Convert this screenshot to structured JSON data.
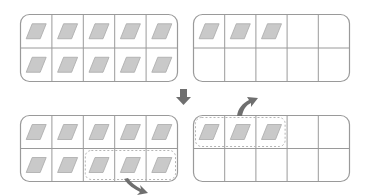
{
  "diagram": {
    "colors": {
      "frame_stroke": "#9a9a9a",
      "grid_stroke": "#9a9a9a",
      "card_fill": "#c9c9c9",
      "card_stroke": "#aaaaaa",
      "arrow_fill": "#6f6f6f",
      "highlight_stroke": "#b5b5b5"
    },
    "frames": [
      {
        "id": "top-left",
        "rows": 2,
        "cols": 5,
        "filled": [
          [
            1,
            1,
            1,
            1,
            1
          ],
          [
            1,
            1,
            1,
            1,
            1
          ]
        ],
        "count": 10
      },
      {
        "id": "top-right",
        "rows": 2,
        "cols": 5,
        "filled": [
          [
            1,
            1,
            1,
            0,
            0
          ],
          [
            0,
            0,
            0,
            0,
            0
          ]
        ],
        "count": 3
      },
      {
        "id": "bottom-left",
        "rows": 2,
        "cols": 5,
        "filled": [
          [
            1,
            1,
            1,
            1,
            1
          ],
          [
            1,
            1,
            1,
            1,
            1
          ]
        ],
        "count": 10,
        "highlight": {
          "row": 1,
          "col_start": 2,
          "col_end": 4
        }
      },
      {
        "id": "bottom-right",
        "rows": 2,
        "cols": 5,
        "filled": [
          [
            1,
            1,
            1,
            0,
            0
          ],
          [
            0,
            0,
            0,
            0,
            0
          ]
        ],
        "count": 3,
        "highlight": {
          "row": 0,
          "col_start": 0,
          "col_end": 2
        }
      }
    ],
    "arrows": [
      {
        "id": "down-arrow",
        "meaning": "transition to next step",
        "direction": "down"
      },
      {
        "id": "curved-arrow-out-bottom-left",
        "meaning": "move highlighted cards out",
        "direction": "down-right"
      },
      {
        "id": "curved-arrow-out-bottom-right",
        "meaning": "move highlighted cards out",
        "direction": "up-right"
      }
    ]
  }
}
